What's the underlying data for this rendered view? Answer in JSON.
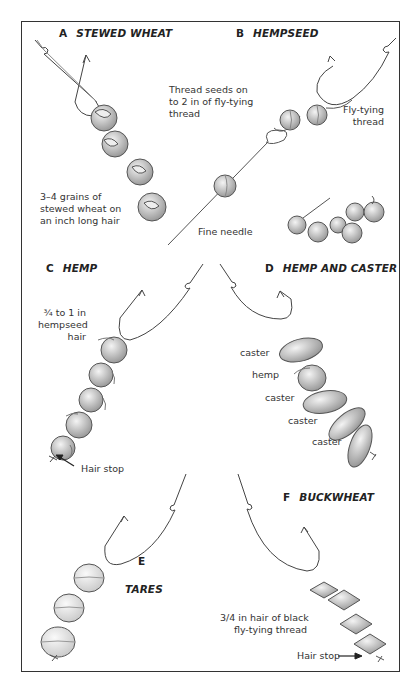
{
  "panels": {
    "a": {
      "letter": "A",
      "title": "STEWED WHEAT",
      "note_lines": [
        "3–4 grains of",
        "stewed wheat on",
        "an inch long hair"
      ]
    },
    "b": {
      "letter": "B",
      "title": "HEMPSEED",
      "note_lines": [
        "Thread seeds on",
        "to 2 in of fly-tying",
        "thread"
      ],
      "thread_lines": [
        "Fly-tying",
        "thread"
      ],
      "needle_label": "Fine needle"
    },
    "c": {
      "letter": "C",
      "title": "HEMP",
      "note_lines": [
        "¾ to 1 in",
        "hempseed",
        "hair"
      ],
      "hair_stop": "Hair stop"
    },
    "d": {
      "letter": "D",
      "title": "HEMP AND CASTER",
      "bait_labels": [
        "caster",
        "hemp",
        "caster",
        "caster",
        "caster"
      ]
    },
    "e": {
      "letter": "E",
      "title": "TARES"
    },
    "f": {
      "letter": "F",
      "title": "BUCKWHEAT",
      "note_lines": [
        "3/4 in hair of black",
        "fly-tying thread"
      ],
      "hair_stop": "Hair stop"
    }
  },
  "colors": {
    "ink": "#333333",
    "shade": "#bdbdbd",
    "paper": "#ffffff"
  }
}
